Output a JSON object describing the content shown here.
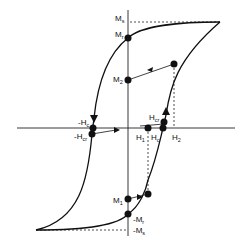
{
  "diagram": {
    "type": "magnetic-hysteresis-loop",
    "axis_labels": {
      "Ms": {
        "main": "M",
        "sub": "s"
      },
      "Mr": {
        "main": "M",
        "sub": "r"
      },
      "M2": {
        "main": "M",
        "sub": "2"
      },
      "negHc": {
        "main": "-H",
        "sub": "c"
      },
      "negHcr": {
        "main": "-H",
        "sub": "cr"
      },
      "Hcr": {
        "main": "H",
        "sub": "cr"
      },
      "H1": {
        "main": "H",
        "sub": "1"
      },
      "Hc": {
        "main": "H",
        "sub": "c"
      },
      "H2": {
        "main": "H",
        "sub": "2"
      },
      "M1": {
        "main": "M",
        "sub": "1"
      },
      "negMr": {
        "main": "-M",
        "sub": "r"
      },
      "negMs": {
        "main": "-M",
        "sub": "s"
      }
    },
    "points": [
      "Mr",
      "M2",
      "upper-branch-point",
      "negHc",
      "negHcr",
      "H1",
      "Hc",
      "lower-branch-point",
      "M1",
      "negMr"
    ],
    "colors": {
      "ink": "#111111",
      "background": "#ffffff"
    }
  }
}
